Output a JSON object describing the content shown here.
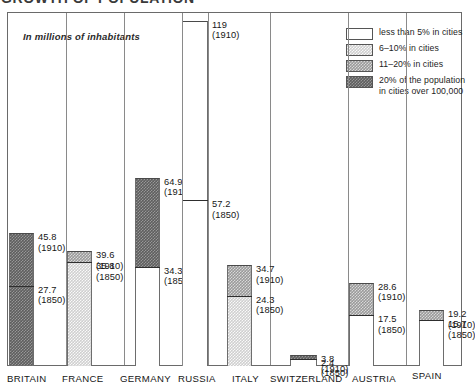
{
  "title_partial": "GROWTH OF POPULATION",
  "note": "In millions of inhabitants",
  "legend": {
    "items": [
      {
        "label": "less than 5% in cities",
        "fill": "none",
        "swatch_color": "#ffffff"
      },
      {
        "label": "6–10% in cities",
        "fill": "light",
        "swatch_color": "#cfcfcf"
      },
      {
        "label": "11–20% in cities",
        "fill": "medium",
        "swatch_color": "#9a9a9a"
      },
      {
        "label": "20% of the population",
        "label2": "in cities over 100,000",
        "fill": "dark",
        "swatch_color": "#5e5e5e"
      }
    ]
  },
  "chart_data": {
    "type": "bar",
    "title": "GROWTH OF POPULATION",
    "subtitle": "In millions of inhabitants",
    "ylabel": "millions of inhabitants",
    "xlabel": "",
    "ylim": [
      0,
      119
    ],
    "grid": false,
    "legend_position": "top-right",
    "categories": [
      "BRITAIN",
      "FRANCE",
      "GERMANY",
      "RUSSIA",
      "ITALY",
      "SWITZERLAND",
      "AUSTRIA",
      "SPAIN"
    ],
    "series": [
      {
        "name": "1850",
        "values": [
          27.7,
          35.8,
          34.3,
          57.2,
          24.3,
          2.4,
          17.5,
          15.7
        ]
      },
      {
        "name": "1910",
        "values": [
          45.8,
          39.6,
          64.9,
          119,
          34.7,
          3.8,
          28.6,
          19.2
        ]
      }
    ],
    "urbanization_band_1850": [
      "dark",
      "light",
      "none",
      "none",
      "light",
      "none",
      "none",
      "none"
    ],
    "urbanization_band_1910": [
      "dark",
      "medium",
      "dark",
      "none",
      "medium",
      "dark",
      "medium",
      "medium"
    ],
    "bars": [
      {
        "country": "BRITAIN",
        "v1850": 27.7,
        "label1850": "27.7",
        "year1850": "(1850)",
        "v1910": 45.8,
        "label1910": "45.8",
        "year1910": "(1910)",
        "fill_lower": "dark",
        "fill_upper": "dark"
      },
      {
        "country": "FRANCE",
        "v1850": 35.8,
        "label1850": "35.8",
        "year1850": "(1850)",
        "v1910": 39.6,
        "label1910": "39.6",
        "year1910": "(1910)",
        "fill_lower": "light",
        "fill_upper": "medium"
      },
      {
        "country": "GERMANY",
        "v1850": 34.3,
        "label1850": "34.3",
        "year1850": "(1850)",
        "v1910": 64.9,
        "label1910": "64.9",
        "year1910": "(1910)",
        "fill_lower": "none",
        "fill_upper": "dark"
      },
      {
        "country": "RUSSIA",
        "v1850": 57.2,
        "label1850": "57.2",
        "year1850": "(1850)",
        "v1910": 119,
        "label1910": "119",
        "year1910": "(1910)",
        "fill_lower": "none",
        "fill_upper": "none"
      },
      {
        "country": "ITALY",
        "v1850": 24.3,
        "label1850": "24.3",
        "year1850": "(1850)",
        "v1910": 34.7,
        "label1910": "34.7",
        "year1910": "(1910)",
        "fill_lower": "light",
        "fill_upper": "medium"
      },
      {
        "country": "SWITZERLAND",
        "v1850": 2.4,
        "label1850": "2.4",
        "year1850": "(1850)",
        "v1910": 3.8,
        "label1910": "3.8",
        "year1910": "(1910)",
        "fill_lower": "none",
        "fill_upper": "dark"
      },
      {
        "country": "AUSTRIA",
        "v1850": 17.5,
        "label1850": "17.5",
        "year1850": "(1850)",
        "v1910": 28.6,
        "label1910": "28.6",
        "year1910": "(1910)",
        "fill_lower": "none",
        "fill_upper": "medium"
      },
      {
        "country": "SPAIN",
        "v1850": 15.7,
        "label1850": "15.7",
        "year1850": "(1850)",
        "v1910": 19.2,
        "label1910": "19.2",
        "year1910": "(1910)",
        "fill_lower": "none",
        "fill_upper": "medium"
      }
    ]
  },
  "axis": {
    "countries": [
      "BRITAIN",
      "FRANCE",
      "GERMANY",
      "RUSSIA",
      "ITALY",
      "SWITZERLAND",
      "AUSTRIA",
      "SPAIN"
    ]
  }
}
